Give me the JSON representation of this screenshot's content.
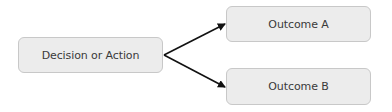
{
  "diagram": {
    "type": "flow",
    "nodes": [
      {
        "id": "decision",
        "label": "Decision or Action"
      },
      {
        "id": "outcome_a",
        "label": "Outcome A"
      },
      {
        "id": "outcome_b",
        "label": "Outcome B"
      }
    ],
    "edges": [
      {
        "from": "decision",
        "to": "outcome_a"
      },
      {
        "from": "decision",
        "to": "outcome_b"
      }
    ],
    "colors": {
      "node_fill": "#ececec",
      "node_border": "#c8c8c8",
      "text": "#3a3a3a",
      "arrow": "#111111"
    }
  }
}
